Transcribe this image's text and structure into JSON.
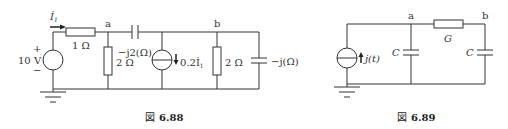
{
  "figures": [
    {
      "id": "fig1",
      "caption_prefix": "図",
      "caption_number": "6.88",
      "source": {
        "type": "voltage",
        "value": "10 V",
        "plus": "+",
        "minus": "−"
      },
      "current_label": "İ",
      "current_sub": "1",
      "nodes": {
        "a": "a",
        "b": "b"
      },
      "components": {
        "r_series": "1 Ω",
        "r_a": "2 Ω",
        "cap_ab": "−j2(Ω)",
        "ccs": "0.2İ",
        "ccs_sub": "1",
        "r_b": "2 Ω",
        "cap_b": "−j(Ω)"
      }
    },
    {
      "id": "fig2",
      "caption_prefix": "図",
      "caption_number": "6.89",
      "source": {
        "type": "current",
        "value": "j(t)"
      },
      "nodes": {
        "a": "a",
        "b": "b"
      },
      "components": {
        "cap_a": "C",
        "g_ab": "G",
        "cap_b": "C"
      }
    }
  ]
}
